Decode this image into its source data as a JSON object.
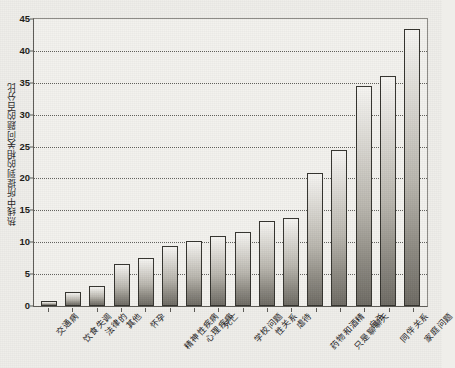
{
  "chart_data": {
    "type": "bar",
    "title": "",
    "xlabel": "",
    "ylabel": "热线中所提到的相关问题的百分比",
    "ylim": [
      0,
      45
    ],
    "yticks": [
      0,
      5,
      10,
      15,
      20,
      25,
      30,
      35,
      40,
      45
    ],
    "grid": true,
    "legend": null,
    "categories": [
      "交通病",
      "饮食失调",
      "法律的",
      "其他",
      "怀孕",
      "精神性疾病",
      "心理疾病",
      "死亡",
      "学校问题",
      "性关系",
      "虐待",
      "药物和酒精",
      "只是聊聊天",
      "自杀",
      "同伴关系",
      "家庭问题"
    ],
    "values": [
      0.8,
      2.2,
      3.1,
      6.6,
      7.6,
      9.4,
      10.2,
      10.9,
      11.6,
      13.3,
      13.8,
      20.8,
      24.5,
      34.5,
      36.0,
      43.5
    ],
    "bar_color": "#b9b6ae",
    "bar_edge_color": "#35342f",
    "background_color": "#efeeea"
  }
}
